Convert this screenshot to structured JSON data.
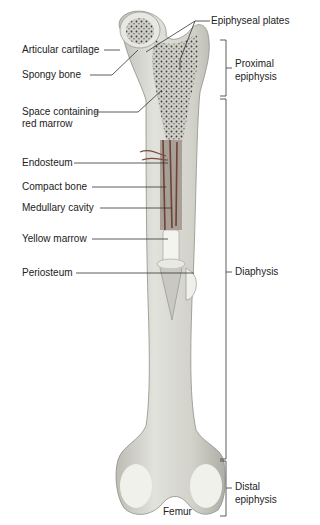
{
  "figure": {
    "title": "Femur",
    "colors": {
      "bone": "#dcdcd4",
      "bone_shadow": "#b8b8b0",
      "cartilage": "#ecece6",
      "spongy": "#3a3a36",
      "marrow_red": "#7a4a3c",
      "yellow_marrow": "#f2f2ec",
      "line": "#333333"
    }
  },
  "left_labels": [
    {
      "id": "articular-cartilage",
      "text": "Articular cartilage"
    },
    {
      "id": "spongy-bone",
      "text": "Spongy bone"
    },
    {
      "id": "space-red-marrow",
      "text": "Space containing red marrow"
    },
    {
      "id": "endosteum",
      "text": "Endosteum"
    },
    {
      "id": "compact-bone",
      "text": "Compact bone"
    },
    {
      "id": "medullary-cavity",
      "text": "Medullary cavity"
    },
    {
      "id": "yellow-marrow",
      "text": "Yellow marrow"
    },
    {
      "id": "periosteum",
      "text": "Periosteum"
    }
  ],
  "top_label": {
    "text": "Epiphyseal plates"
  },
  "regions": [
    {
      "id": "proximal-epiphysis",
      "line1": "Proximal",
      "line2": "epiphysis"
    },
    {
      "id": "diaphysis",
      "line1": "Diaphysis"
    },
    {
      "id": "distal-epiphysis",
      "line1": "Distal",
      "line2": "epiphysis"
    }
  ],
  "caption": "Femur"
}
